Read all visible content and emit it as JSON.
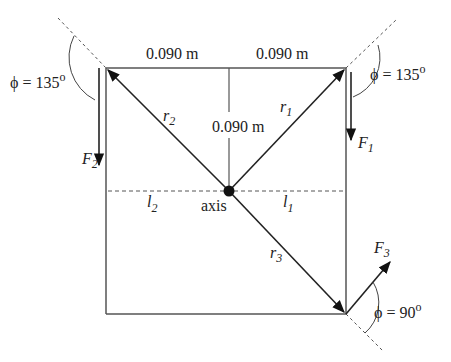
{
  "diagram": {
    "dimensions": {
      "top_left": "0.090 m",
      "top_right": "0.090 m",
      "vertical": "0.090 m"
    },
    "axis_label": "axis",
    "radii": [
      {
        "symbol": "r",
        "sub": "1"
      },
      {
        "symbol": "r",
        "sub": "2"
      },
      {
        "symbol": "r",
        "sub": "3"
      }
    ],
    "forces": [
      {
        "symbol": "F",
        "sub": "1"
      },
      {
        "symbol": "F",
        "sub": "2"
      },
      {
        "symbol": "F",
        "sub": "3"
      }
    ],
    "lever_arms": [
      {
        "symbol": "l",
        "sub": "1"
      },
      {
        "symbol": "l",
        "sub": "2"
      }
    ],
    "angles": {
      "phi_top_left": "ϕ = 135",
      "phi_top_right": "ϕ = 135",
      "phi_bottom_right": "ϕ = 90",
      "degree": "o"
    },
    "colors": {
      "line": "#222222",
      "frame": "#555555"
    }
  }
}
